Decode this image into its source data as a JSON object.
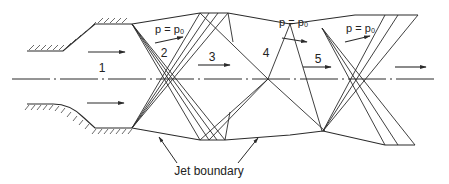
{
  "figure": {
    "regions": [
      {
        "id": "1",
        "label": "1"
      },
      {
        "id": "2",
        "label": "2"
      },
      {
        "id": "3",
        "label": "3"
      },
      {
        "id": "4",
        "label": "4"
      },
      {
        "id": "5",
        "label": "5"
      }
    ],
    "pressure_labels": [
      {
        "text": "p = p₀",
        "region": "2"
      },
      {
        "text": "p = p₀",
        "region": "4"
      },
      {
        "text": "p = p₀",
        "region": "after-5"
      }
    ],
    "callout": {
      "text": "Jet boundary"
    },
    "colors": {
      "line": "#2a2a2a",
      "background": "#ffffff"
    }
  }
}
